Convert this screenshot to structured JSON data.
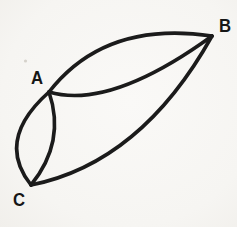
{
  "figure": {
    "background_color": "#f6f5f2",
    "stroke_color": "#1b1b1b",
    "label_color": "#161616",
    "stroke_width": 3.6,
    "vertices": {
      "A": [
        49,
        92
      ],
      "B": [
        212,
        36
      ],
      "C": [
        31,
        185
      ]
    },
    "labels": [
      {
        "text": "A",
        "x": 37,
        "y": 78
      },
      {
        "text": "B",
        "x": 225,
        "y": 26
      },
      {
        "text": "C",
        "x": 19,
        "y": 200
      }
    ],
    "arcs": [
      {
        "name": "arc-ab-upper",
        "from": "A",
        "to": "B",
        "control": [
          105,
          20
        ]
      },
      {
        "name": "arc-ab-lower",
        "from": "A",
        "to": "B",
        "control": [
          110,
          110
        ]
      },
      {
        "name": "arc-ac-left",
        "from": "A",
        "to": "C",
        "control": [
          -5,
          140
        ]
      },
      {
        "name": "arc-ac-right",
        "from": "A",
        "to": "C",
        "control": [
          66,
          142
        ]
      },
      {
        "name": "arc-cb-outer",
        "from": "C",
        "to": "B",
        "control": [
          141,
          163
        ]
      }
    ],
    "speck": {
      "x": 25.5,
      "y": 61,
      "r": 1.6,
      "color": "#b9b4ac",
      "opacity": 0.55
    }
  }
}
